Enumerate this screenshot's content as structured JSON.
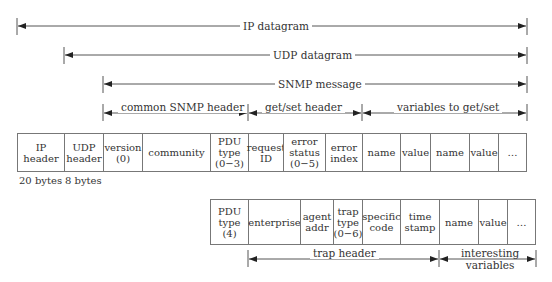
{
  "spans": {
    "ip_datagram": "IP datagram",
    "udp_datagram": "UDP datagram",
    "snmp_message": "SNMP message",
    "common_header": "common SNMP header",
    "getset_header": "get/set header",
    "variables": "variables to get/set",
    "trap_header": "trap header",
    "interesting_vars": "interesting\nvariables"
  },
  "main_row": [
    {
      "label": "IP\nheader"
    },
    {
      "label": "UDP\nheader"
    },
    {
      "label": "version\n(0)"
    },
    {
      "label": "community"
    },
    {
      "label": "PDU\ntype\n(0−3)"
    },
    {
      "label": "request\nID"
    },
    {
      "label": "error\nstatus\n(0−5)"
    },
    {
      "label": "error\nindex"
    },
    {
      "label": "name"
    },
    {
      "label": "value"
    },
    {
      "label": "name"
    },
    {
      "label": "value"
    },
    {
      "label": "…"
    }
  ],
  "sizes": {
    "ip": "20 bytes",
    "udp": "8 bytes"
  },
  "trap_row": [
    {
      "label": "PDU\ntype\n(4)"
    },
    {
      "label": "enterprise"
    },
    {
      "label": "agent\naddr"
    },
    {
      "label": "trap\ntype\n(0−6)"
    },
    {
      "label": "specific\ncode"
    },
    {
      "label": "time\nstamp"
    },
    {
      "label": "name"
    },
    {
      "label": "value"
    },
    {
      "label": "…"
    }
  ]
}
